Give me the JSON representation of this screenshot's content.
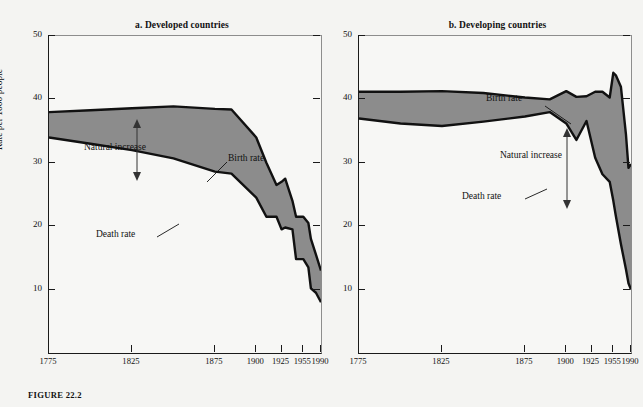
{
  "figure": {
    "caption": "FIGURE 22.2",
    "y_axis_label": "Rate per 1000 people"
  },
  "panels": [
    {
      "id": "a",
      "title": "a. Developed countries",
      "annotations": {
        "natural_increase": "Natural increase",
        "birth_rate": "Birth rate",
        "death_rate": "Death rate"
      }
    },
    {
      "id": "b",
      "title": "b. Developing countries",
      "annotations": {
        "natural_increase": "Natural increase",
        "birth_rate": "Birth rate",
        "death_rate": "Death rate"
      }
    }
  ],
  "chart_data": [
    {
      "type": "area",
      "title": "a. Developed countries",
      "xlabel": "",
      "ylabel": "Rate per 1000 people",
      "ylim": [
        0,
        50
      ],
      "yticks": [
        10,
        20,
        30,
        40,
        50
      ],
      "xticks": [
        1775,
        1825,
        1875,
        1900,
        1925,
        1955,
        1990
      ],
      "xtick_positions_frac": [
        0.0,
        0.305,
        0.61,
        0.762,
        0.855,
        0.935,
        1.0
      ],
      "grid": false,
      "legend": "inline-annotations",
      "fill_color": "#8c8c8c",
      "line_color": "#111111",
      "series": [
        {
          "name": "Birth rate",
          "x": [
            1775,
            1800,
            1825,
            1850,
            1875,
            1885,
            1900,
            1910,
            1920,
            1925,
            1930,
            1940,
            1945,
            1955,
            1965,
            1970,
            1980,
            1990
          ],
          "values": [
            38,
            38.3,
            38.6,
            38.9,
            38.5,
            38.4,
            34,
            30,
            26.5,
            27,
            27.5,
            24,
            21.5,
            21.5,
            20.5,
            18,
            15.5,
            13
          ]
        },
        {
          "name": "Death rate",
          "x": [
            1775,
            1800,
            1825,
            1850,
            1875,
            1885,
            1900,
            1910,
            1920,
            1925,
            1930,
            1940,
            1945,
            1955,
            1965,
            1970,
            1980,
            1990
          ],
          "values": [
            34,
            33,
            32,
            30.7,
            28.6,
            28.3,
            24.5,
            21.5,
            21.5,
            19.5,
            19.8,
            19.5,
            14.8,
            14.8,
            13.5,
            10.2,
            9.5,
            8
          ]
        }
      ],
      "derived": {
        "natural_increase_label": "Natural increase",
        "description": "Shaded band between birth rate (upper) and death rate (lower)."
      }
    },
    {
      "type": "area",
      "title": "b. Developing countries",
      "xlabel": "",
      "ylabel": "Rate per 1000 people",
      "ylim": [
        0,
        50
      ],
      "yticks": [
        10,
        20,
        30,
        40,
        50
      ],
      "xticks": [
        1775,
        1825,
        1875,
        1900,
        1925,
        1955,
        1990
      ],
      "xtick_positions_frac": [
        0.0,
        0.305,
        0.61,
        0.762,
        0.855,
        0.935,
        1.0
      ],
      "grid": false,
      "legend": "inline-annotations",
      "fill_color": "#8c8c8c",
      "line_color": "#111111",
      "series": [
        {
          "name": "Birth rate",
          "x": [
            1775,
            1800,
            1825,
            1850,
            1875,
            1890,
            1900,
            1910,
            1920,
            1930,
            1940,
            1950,
            1955,
            1960,
            1970,
            1980,
            1985,
            1990
          ],
          "values": [
            41.2,
            41.2,
            41.3,
            41.0,
            40.3,
            40.0,
            41.3,
            40.4,
            40.5,
            41.2,
            41.2,
            40.3,
            44.2,
            43.8,
            42.0,
            34.5,
            29.2,
            29.8
          ]
        },
        {
          "name": "Death rate",
          "x": [
            1775,
            1800,
            1825,
            1850,
            1875,
            1890,
            1900,
            1910,
            1920,
            1930,
            1940,
            1950,
            1955,
            1960,
            1970,
            1980,
            1985,
            1990
          ],
          "values": [
            37.0,
            36.2,
            35.8,
            36.5,
            37.3,
            38.0,
            36.2,
            33.6,
            36.6,
            30.8,
            28.2,
            27.0,
            24.0,
            21.6,
            17.2,
            13.2,
            11.0,
            10.0
          ]
        }
      ],
      "derived": {
        "natural_increase_label": "Natural increase",
        "description": "Shaded band between birth rate (upper) and death rate (lower)."
      }
    }
  ]
}
